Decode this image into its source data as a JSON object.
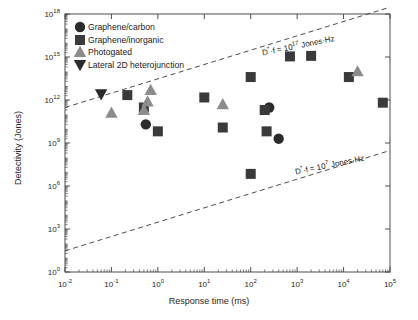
{
  "chart_data": {
    "type": "scatter",
    "title": "",
    "xlabel": "Response time (ms)",
    "ylabel": "Detectivity (Jones)",
    "xscale": "log",
    "yscale": "log",
    "xlim": [
      0.01,
      100000
    ],
    "ylim": [
      1,
      1e+18
    ],
    "grid": false,
    "legend_position": "top-left",
    "xticks": [
      {
        "value": 0.01,
        "label": "10",
        "exp": "-2"
      },
      {
        "value": 0.1,
        "label": "10",
        "exp": "-1"
      },
      {
        "value": 1,
        "label": "10",
        "exp": "0"
      },
      {
        "value": 10,
        "label": "10",
        "exp": "1"
      },
      {
        "value": 100,
        "label": "10",
        "exp": "2"
      },
      {
        "value": 1000,
        "label": "10",
        "exp": "3"
      },
      {
        "value": 10000,
        "label": "10",
        "exp": "4"
      },
      {
        "value": 100000,
        "label": "10",
        "exp": "5"
      }
    ],
    "yticks": [
      {
        "value": 1,
        "label": "10",
        "exp": "0"
      },
      {
        "value": 1000.0,
        "label": "10",
        "exp": "3"
      },
      {
        "value": 1000000.0,
        "label": "10",
        "exp": "6"
      },
      {
        "value": 1000000000.0,
        "label": "10",
        "exp": "9"
      },
      {
        "value": 1000000000000.0,
        "label": "10",
        "exp": "12"
      },
      {
        "value": 1000000000000000.0,
        "label": "10",
        "exp": "15"
      },
      {
        "value": 1e+18,
        "label": "10",
        "exp": "18"
      }
    ],
    "series": [
      {
        "name": "Graphene/carbon",
        "marker": "circle",
        "color": "#2b2b2b",
        "points": [
          {
            "x": 0.55,
            "y": 20000000000.0
          },
          {
            "x": 250,
            "y": 300000000000.0
          },
          {
            "x": 400,
            "y": 2000000000.0
          }
        ]
      },
      {
        "name": "Graphene/inorganic",
        "marker": "square",
        "color": "#3a3a3a",
        "points": [
          {
            "x": 0.22,
            "y": 2200000000000.0
          },
          {
            "x": 0.5,
            "y": 300000000000.0
          },
          {
            "x": 1.0,
            "y": 6500000000.0
          },
          {
            "x": 10,
            "y": 1500000000000.0
          },
          {
            "x": 25,
            "y": 12000000000.0
          },
          {
            "x": 100,
            "y": 40000000000000.0
          },
          {
            "x": 100,
            "y": 7000000.0
          },
          {
            "x": 200,
            "y": 200000000000.0
          },
          {
            "x": 220,
            "y": 6500000000.0
          },
          {
            "x": 700,
            "y": 1100000000000000.0
          },
          {
            "x": 2000,
            "y": 1200000000000000.0
          },
          {
            "x": 13000,
            "y": 40000000000000.0
          },
          {
            "x": 70000,
            "y": 650000000000.0
          }
        ]
      },
      {
        "name": "Photogated",
        "marker": "triangle-up",
        "color": "#8c8c8c",
        "points": [
          {
            "x": 0.1,
            "y": 130000000000.0
          },
          {
            "x": 0.5,
            "y": 200000000000.0
          },
          {
            "x": 0.6,
            "y": 800000000000.0
          },
          {
            "x": 0.7,
            "y": 5000000000000.0
          },
          {
            "x": 25,
            "y": 500000000000.0
          },
          {
            "x": 20000,
            "y": 100000000000000.0
          }
        ]
      },
      {
        "name": "Lateral 2D heterojunction",
        "marker": "triangle-down",
        "color": "#2b2b2b",
        "points": [
          {
            "x": 0.06,
            "y": 2500000000000.0
          }
        ]
      }
    ],
    "annotations": [
      {
        "id": "upper-line",
        "prefix": "D",
        "star": "*",
        "mid": "·f = 10",
        "exp": "17",
        "suffix": " Jones·Hz",
        "line": {
          "x1": 0.01,
          "y1": 300000000000.0,
          "x2": 100000,
          "y2": 3e+18
        },
        "style": "dashed"
      },
      {
        "id": "lower-line",
        "prefix": "D",
        "star": "*",
        "mid": "·f = 10",
        "exp": "7",
        "suffix": " Jones·Hz",
        "line": {
          "x1": 0.01,
          "y1": 30.0,
          "x2": 100000,
          "y2": 300000000.0
        },
        "style": "dashed"
      }
    ]
  },
  "legend": {
    "items": [
      {
        "label": "Graphene/carbon",
        "marker": "circle",
        "color": "#2b2b2b"
      },
      {
        "label": "Graphene/inorganic",
        "marker": "square",
        "color": "#3a3a3a"
      },
      {
        "label": "Photogated",
        "marker": "triangle-up",
        "color": "#8c8c8c"
      },
      {
        "label": "Lateral 2D heterojunction",
        "marker": "triangle-down",
        "color": "#2b2b2b"
      }
    ]
  },
  "colors": {
    "axis": "#4d4d4d",
    "text": "#1a1a1a",
    "dashed": "#4d4d4d",
    "background": "#ffffff"
  }
}
